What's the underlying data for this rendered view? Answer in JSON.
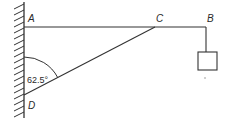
{
  "diagram": {
    "type": "statics-bracket",
    "points": {
      "A": {
        "label": "A",
        "x": 24,
        "y": 27
      },
      "B": {
        "label": "B",
        "x": 206,
        "y": 27
      },
      "C": {
        "label": "C",
        "x": 155,
        "y": 27
      },
      "D": {
        "label": "D",
        "x": 24,
        "y": 95
      }
    },
    "angle": {
      "label": "62.5°",
      "vertex": "D",
      "value_deg": 62.5
    },
    "members": [
      "AB (horizontal beam)",
      "CD (strut)"
    ],
    "load": {
      "type": "hanging-block",
      "attached_at": "B"
    },
    "wall": {
      "side": "left",
      "hatched": true
    },
    "colors": {
      "line": "#333333",
      "background": "#ffffff"
    }
  }
}
